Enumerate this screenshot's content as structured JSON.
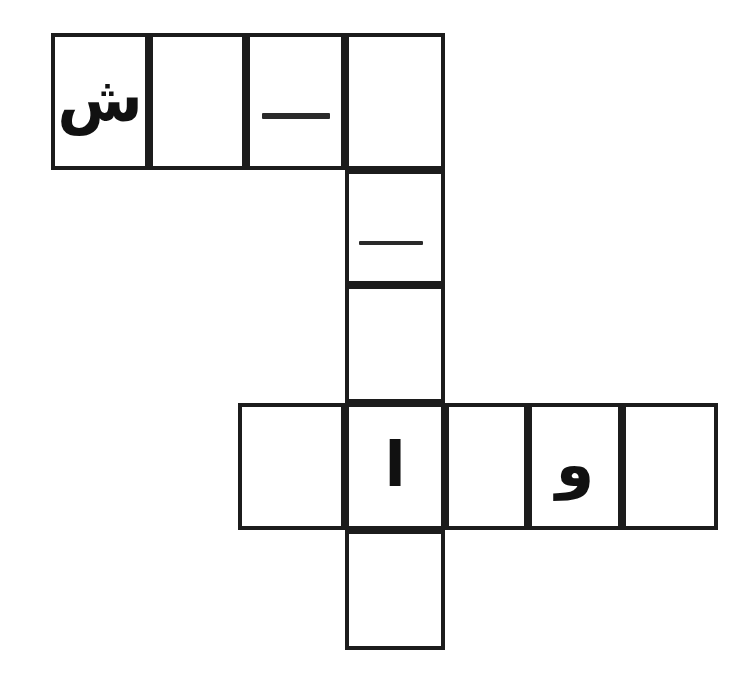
{
  "document": {
    "title": "Arabic Crossword Puzzle Grid",
    "language": "Arabic",
    "direction": "rtl",
    "background_color": "#ffffff",
    "grid_line_color": "#1c1c1c",
    "glyph_color": "#111111"
  },
  "grid": {
    "cell_size": 98,
    "border_width": 4,
    "rows": [
      {
        "id": "top-row",
        "orientation": "horizontal",
        "cell_count": 4,
        "cells": [
          {
            "id": "r1c1",
            "letter": "ش",
            "filled": true,
            "mark": "letter"
          },
          {
            "id": "r1c2",
            "letter": "",
            "filled": false,
            "mark": "blank"
          },
          {
            "id": "r1c3",
            "letter": "",
            "filled": false,
            "mark": "dash"
          },
          {
            "id": "r1c4",
            "letter": "",
            "filled": false,
            "mark": "blank"
          }
        ]
      },
      {
        "id": "middle-column",
        "orientation": "vertical",
        "cell_count": 2,
        "cells": [
          {
            "id": "c2r2",
            "letter": "",
            "filled": false,
            "mark": "dash"
          },
          {
            "id": "c2r3",
            "letter": "",
            "filled": false,
            "mark": "blank"
          }
        ]
      },
      {
        "id": "bottom-row",
        "orientation": "horizontal",
        "cell_count": 5,
        "cells": [
          {
            "id": "r4c1",
            "letter": "",
            "filled": false,
            "mark": "blank"
          },
          {
            "id": "r4c2",
            "letter": "ا",
            "filled": true,
            "mark": "letter"
          },
          {
            "id": "r4c3",
            "letter": "",
            "filled": false,
            "mark": "blank"
          },
          {
            "id": "r4c4",
            "letter": "و",
            "filled": true,
            "mark": "letter"
          },
          {
            "id": "r4c5",
            "letter": "",
            "filled": false,
            "mark": "blank"
          }
        ]
      },
      {
        "id": "bottom-extension",
        "orientation": "vertical",
        "cell_count": 1,
        "cells": [
          {
            "id": "r5c2",
            "letter": "",
            "filled": false,
            "mark": "blank"
          }
        ]
      }
    ],
    "filled_letters": [
      "ش",
      "ا",
      "و"
    ],
    "dash_marks": 2,
    "total_cells": 12
  }
}
